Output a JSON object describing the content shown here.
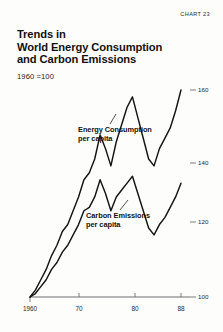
{
  "figure": {
    "chart_number": "CHART 23",
    "title_lines": [
      "Trends in",
      "World Energy Consumption",
      "and Carbon Emissions"
    ],
    "subtitle": "1960 =100"
  },
  "annotations": {
    "energy": {
      "line1": "Energy Consumption",
      "line2": "per capita"
    },
    "carbon": {
      "line1": "Carbon Emissions",
      "line2": "per capita"
    }
  },
  "axes": {
    "y_ticks": [
      {
        "label": "100",
        "value": 100
      },
      {
        "label": "120",
        "value": 120
      },
      {
        "label": "140",
        "value": 140
      },
      {
        "label": "160",
        "value": 160
      }
    ],
    "x_ticks": [
      {
        "label": "1960",
        "value": 1960
      },
      {
        "label": "70",
        "value": 1970
      },
      {
        "label": "80",
        "value": 1980
      },
      {
        "label": "88",
        "value": 1988
      }
    ]
  },
  "colors": {
    "line": "#141414",
    "axis": "#6e6e6e",
    "text": "#111111",
    "background": "#fdfdfc"
  },
  "chart_data": {
    "type": "line",
    "title": "Trends in World Energy Consumption and Carbon Emissions",
    "subtitle": "1960 =100",
    "xlabel": "",
    "ylabel": "Index (1960 = 100)",
    "xlim": [
      1960,
      1988
    ],
    "ylim": [
      100,
      165
    ],
    "grid": false,
    "legend": "inline-annotations",
    "x": [
      1960,
      1961,
      1962,
      1963,
      1964,
      1965,
      1966,
      1967,
      1968,
      1969,
      1970,
      1971,
      1972,
      1973,
      1974,
      1975,
      1976,
      1977,
      1978,
      1979,
      1980,
      1981,
      1982,
      1983,
      1984,
      1985,
      1986,
      1987,
      1988
    ],
    "series": [
      {
        "name": "Energy Consumption per capita",
        "values": [
          100,
          102,
          105,
          108,
          112,
          115,
          119,
          121,
          125,
          129,
          134,
          136,
          140,
          147,
          143,
          138,
          145,
          150,
          155,
          158,
          152,
          146,
          140,
          138,
          143,
          146,
          149,
          154,
          160
        ]
      },
      {
        "name": "Carbon Emissions per capita",
        "values": [
          100,
          101,
          103,
          105,
          108,
          110,
          113,
          115,
          118,
          121,
          125,
          126,
          129,
          134,
          130,
          125,
          129,
          131,
          133,
          135,
          130,
          125,
          120,
          118,
          121,
          123,
          126,
          129,
          133
        ]
      }
    ]
  }
}
